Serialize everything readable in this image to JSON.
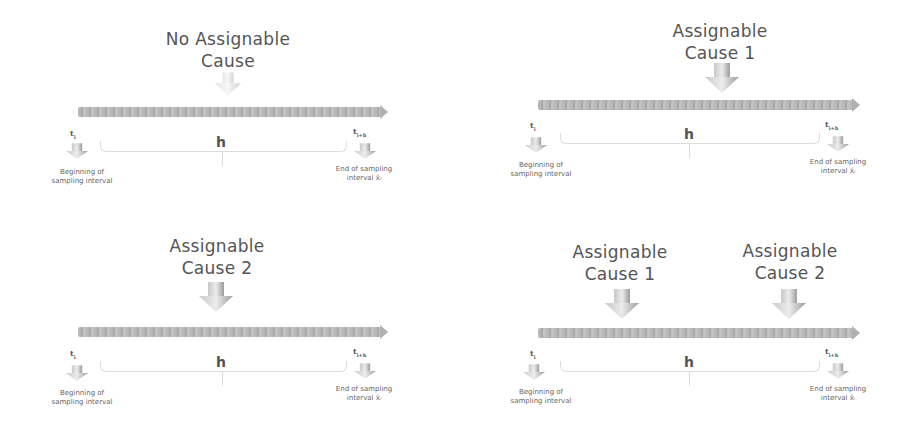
{
  "panels": [
    {
      "id": "no-cause",
      "title_line1": "No Assignable",
      "title_line2": "Cause",
      "t_start": "t",
      "t_start_sub": "i",
      "t_end": "t",
      "t_end_sub": "i+h",
      "interval_label": "h",
      "begin_line1": "Beginning of",
      "begin_line2": "sampling interval",
      "end_line1": "End of  sampling",
      "end_line2": "interval x̄ᵢ"
    },
    {
      "id": "cause-1",
      "title_line1": "Assignable",
      "title_line2": "Cause 1",
      "t_start": "t",
      "t_start_sub": "i",
      "t_end": "t",
      "t_end_sub": "i+h",
      "interval_label": "h",
      "begin_line1": "Beginning of",
      "begin_line2": "sampling interval",
      "end_line1": "End of  sampling",
      "end_line2": "interval x̄ᵢ"
    },
    {
      "id": "cause-2",
      "title_line1": "Assignable",
      "title_line2": "Cause 2",
      "t_start": "t",
      "t_start_sub": "i",
      "t_end": "t",
      "t_end_sub": "i+h",
      "interval_label": "h",
      "begin_line1": "Beginning of",
      "begin_line2": "sampling interval",
      "end_line1": "End of  sampling",
      "end_line2": "interval x̄ᵢ"
    },
    {
      "id": "both-causes",
      "causes": [
        {
          "title_line1": "Assignable",
          "title_line2": "Cause 1"
        },
        {
          "title_line1": "Assignable",
          "title_line2": "Cause 2"
        }
      ],
      "t_start": "t",
      "t_start_sub": "i",
      "t_end": "t",
      "t_end_sub": "i+h",
      "interval_label": "h",
      "begin_line1": "Beginning of",
      "begin_line2": "sampling interval",
      "end_line1": "End of  sampling",
      "end_line2": "interval x̄ᵢ"
    }
  ],
  "colors": {
    "bar": "#b3b3b3",
    "arrow": "#9a9a9a",
    "text": "#555555"
  }
}
